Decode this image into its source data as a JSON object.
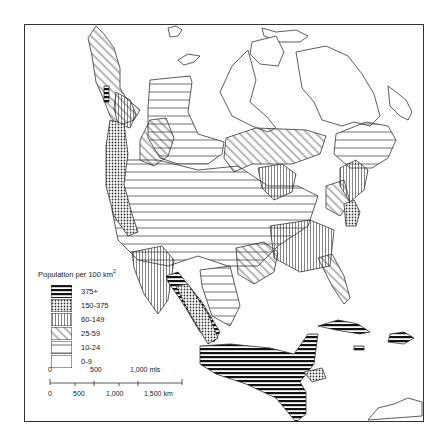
{
  "map": {
    "title": "Population per 100 km",
    "title_superscript": "2",
    "legend": [
      {
        "label": "375+",
        "pattern": "dense-horizontal"
      },
      {
        "label": "150-375",
        "pattern": "crosshatch"
      },
      {
        "label": "60-149",
        "pattern": "vertical"
      },
      {
        "label": "25-59",
        "pattern": "diagonal"
      },
      {
        "label": "10-24",
        "pattern": "sparse-horizontal"
      },
      {
        "label": "0-9",
        "pattern": "blank"
      }
    ],
    "scale": {
      "miles_ticks": [
        "0",
        "500",
        "1,000 mls"
      ],
      "km_ticks": [
        "0",
        "500",
        "1,000",
        "1,500 km"
      ]
    },
    "colors": {
      "ink": "#222222",
      "paper": "#ffffff",
      "frame": "#333333"
    }
  }
}
